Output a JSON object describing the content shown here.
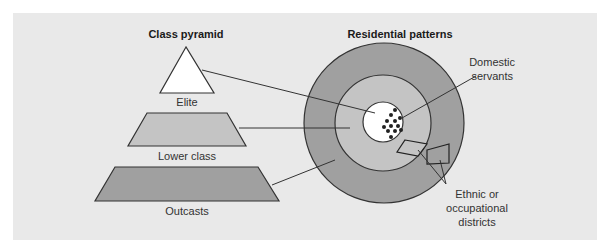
{
  "diagram": {
    "left_title": "Class pyramid",
    "right_title": "Residential patterns",
    "pyramid_levels": [
      {
        "label": "Elite",
        "shape": "triangle",
        "color": "#ffffff"
      },
      {
        "label": "Lower class",
        "shape": "trapezoid",
        "color": "#c4c4c4"
      },
      {
        "label": "Outcasts",
        "shape": "trapezoid",
        "color": "#a0a0a0"
      }
    ],
    "rings": [
      {
        "name": "outer",
        "color": "#a0a0a0"
      },
      {
        "name": "middle",
        "color": "#c4c4c4"
      },
      {
        "name": "center",
        "color": "#ffffff"
      }
    ],
    "annotations": {
      "domestic_line1": "Domestic",
      "domestic_line2": "servants",
      "ethnic_line1": "Ethnic or",
      "ethnic_line2": "occupational",
      "ethnic_line3": "districts"
    },
    "colors": {
      "panel_bg": "#e9e9e9",
      "stroke": "#333333",
      "dot": "#222222"
    }
  }
}
